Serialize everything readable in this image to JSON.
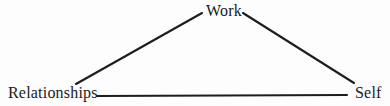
{
  "diagram": {
    "type": "triangle",
    "nodes": {
      "work": {
        "label": "Work"
      },
      "relationships": {
        "label": "Relationships"
      },
      "self": {
        "label": "Self"
      }
    },
    "edges": [
      {
        "from": "Work",
        "to": "Relationships"
      },
      {
        "from": "Work",
        "to": "Self"
      },
      {
        "from": "Relationships",
        "to": "Self"
      }
    ],
    "colors": {
      "line": "#1d1d1d",
      "text": "#1b1b1b",
      "background": "#fdfdfd"
    }
  }
}
